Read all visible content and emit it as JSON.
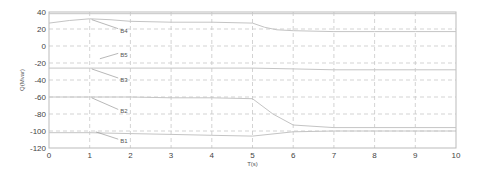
{
  "chart_data": {
    "type": "line",
    "title": "",
    "xlabel": "T(s)",
    "ylabel": "Q(Mvar)",
    "xlim": [
      0,
      10
    ],
    "ylim": [
      -120,
      40
    ],
    "grid": true,
    "x_ticks": [
      "0",
      "1",
      "2",
      "3",
      "4",
      "5",
      "6",
      "7",
      "8",
      "9",
      "10"
    ],
    "y_ticks": [
      "40",
      "20",
      "0",
      "-20",
      "-40",
      "-60",
      "-80",
      "-100",
      "-120"
    ],
    "series": [
      {
        "name": "B4",
        "x": [
          0,
          0.5,
          1,
          1.5,
          2,
          3,
          4,
          5,
          5.3,
          5.6,
          6,
          7,
          8,
          9,
          10
        ],
        "values": [
          27,
          30,
          32,
          31,
          29,
          28,
          28,
          27,
          22,
          19,
          18,
          17,
          17,
          17,
          17
        ]
      },
      {
        "name": "B5",
        "x": [
          0,
          1,
          2,
          3,
          4,
          5,
          6,
          7,
          8,
          9,
          10
        ],
        "values": [
          38,
          38,
          38,
          38,
          38,
          38,
          38,
          38,
          38,
          38,
          38
        ]
      },
      {
        "name": "B3",
        "x": [
          0,
          1,
          2,
          3,
          4,
          5,
          6,
          7,
          8,
          9,
          10
        ],
        "values": [
          -26,
          -26,
          -26,
          -26,
          -26,
          -26,
          -27,
          -28,
          -28,
          -28,
          -28
        ]
      },
      {
        "name": "B2",
        "x": [
          0,
          1,
          2,
          3,
          4,
          5,
          5.5,
          6,
          7,
          8,
          9,
          10
        ],
        "values": [
          -60,
          -60,
          -60,
          -61,
          -61,
          -62,
          -80,
          -93,
          -96,
          -96,
          -96,
          -96
        ]
      },
      {
        "name": "B1",
        "x": [
          0,
          1,
          2,
          3,
          4,
          5,
          6,
          7,
          8,
          9,
          10
        ],
        "values": [
          -102,
          -102,
          -103,
          -104,
          -105,
          -106,
          -101,
          -100,
          -100,
          -100,
          -100
        ]
      }
    ],
    "annotations": [
      {
        "text": "B4",
        "x": 1.75,
        "y": 18
      },
      {
        "text": "B5",
        "x": 1.75,
        "y": -11
      },
      {
        "text": "B3",
        "x": 1.75,
        "y": -40
      },
      {
        "text": "B2",
        "x": 1.75,
        "y": -77
      },
      {
        "text": "B1",
        "x": 1.75,
        "y": -112
      }
    ],
    "legend": "none"
  }
}
